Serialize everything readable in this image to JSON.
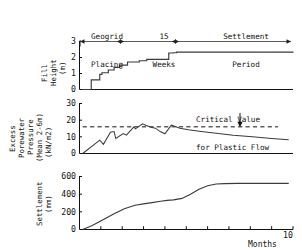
{
  "figure": {
    "title": "",
    "x_axis_label": "Months",
    "x_max_label": "10",
    "periods": [
      {
        "name": "geogrid-placing",
        "label": "Geogrid\nPlacing",
        "label_line1": "Geogrid",
        "label_line2": "Placing",
        "start_month": 0.15,
        "end_month": 1.7
      },
      {
        "name": "fifteen-weeks",
        "label": "15\nWeeks",
        "label_line1": "15",
        "label_line2": "Weeks",
        "start_month": 1.7,
        "end_month": 4.3
      },
      {
        "name": "settlement-period",
        "label": "Settlement\nPeriod",
        "label_line1": "Settlement",
        "label_line2": "Period",
        "start_month": 4.3,
        "end_month": 9.6
      }
    ],
    "annotation": {
      "name": "critical-value-note",
      "line1": "Critical Value",
      "line2": "for Plastic Flow",
      "points_to_value": 16
    }
  },
  "chart_data": [
    {
      "type": "line",
      "name": "fill-height",
      "title": "",
      "xlabel": "",
      "ylabel": "Fill Height (m)",
      "ylabel_line1": "Fill",
      "ylabel_line2": "Height",
      "ylabel_line3": "(m)",
      "ylim": [
        0,
        3
      ],
      "xlim": [
        0,
        10
      ],
      "yticks": [
        0,
        1,
        2,
        3
      ],
      "ytick_labels": [
        "0",
        "1",
        "2",
        "3"
      ],
      "grid": false,
      "legend": "none",
      "step": true,
      "x": [
        0.12,
        0.55,
        0.95,
        1.05,
        1.25,
        1.35,
        1.55,
        1.62,
        1.8,
        1.88,
        2.15,
        2.25,
        2.7,
        2.8,
        3.05,
        3.15,
        4.05,
        4.18,
        4.4,
        4.55,
        10.0
      ],
      "y": [
        0.0,
        0.6,
        0.95,
        1.05,
        1.05,
        1.22,
        1.22,
        1.38,
        1.38,
        1.52,
        1.52,
        1.72,
        1.72,
        1.8,
        1.8,
        1.88,
        1.88,
        2.28,
        2.3,
        2.34,
        2.36
      ]
    },
    {
      "type": "line",
      "name": "excess-porewater-pressure",
      "title": "",
      "xlabel": "",
      "ylabel": "Excess Porewater Pressure (Mean 2-6m) (kN/m2)",
      "ylabel_line1": "Excess",
      "ylabel_line2": "Porewater",
      "ylabel_line3": "Pressure",
      "ylabel_line4": "(Mean 2-6m)",
      "ylabel_line5": "(kN/m2)",
      "ylim": [
        0,
        30
      ],
      "xlim": [
        0,
        10
      ],
      "yticks": [
        0,
        10,
        20,
        30
      ],
      "ytick_labels": [
        "0",
        "10",
        "20",
        "30"
      ],
      "grid": false,
      "legend": "none",
      "critical_value": 16,
      "critical_line_style": "dashed",
      "critical_line_start_month": 0.15,
      "critical_line_end_month": 9.3,
      "x": [
        0.15,
        0.95,
        1.12,
        1.45,
        1.62,
        1.7,
        2.05,
        2.2,
        2.55,
        2.62,
        2.95,
        3.1,
        3.35,
        3.55,
        3.8,
        4.0,
        4.3,
        4.42,
        4.7,
        5.1,
        5.7,
        6.4,
        7.2,
        8.1,
        9.0,
        9.8
      ],
      "y": [
        0.0,
        8.0,
        5.5,
        12.8,
        13.2,
        9.0,
        12.0,
        11.0,
        16.0,
        14.8,
        17.8,
        17.0,
        15.8,
        15.2,
        13.0,
        11.8,
        17.0,
        16.5,
        15.2,
        14.2,
        13.2,
        12.2,
        11.0,
        10.0,
        9.0,
        8.2
      ]
    },
    {
      "type": "line",
      "name": "settlement",
      "title": "",
      "xlabel": "Months",
      "ylabel": "Settlement (mm)",
      "ylabel_line1": "Settlement",
      "ylabel_line2": "(mm)",
      "ylim": [
        0,
        600
      ],
      "xlim": [
        0,
        10
      ],
      "yticks": [
        0,
        200,
        400,
        600
      ],
      "ytick_labels": [
        "0",
        "200",
        "400",
        "600"
      ],
      "xticks": [
        1,
        2,
        3,
        4,
        5,
        6,
        7,
        8,
        9,
        10
      ],
      "grid": false,
      "legend": "none",
      "x": [
        0.15,
        0.6,
        1.1,
        1.6,
        2.1,
        2.6,
        3.0,
        3.4,
        3.8,
        4.1,
        4.4,
        4.8,
        5.2,
        5.6,
        6.0,
        6.4,
        6.8,
        7.4,
        8.2,
        9.0,
        9.8
      ],
      "y": [
        0,
        45,
        110,
        175,
        235,
        275,
        290,
        305,
        320,
        330,
        335,
        352,
        400,
        455,
        495,
        515,
        520,
        522,
        522,
        522,
        522
      ]
    }
  ]
}
